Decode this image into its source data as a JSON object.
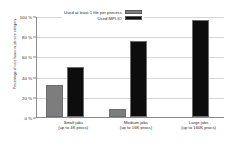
{
  "chart_data": {
    "type": "bar",
    "title": "",
    "xlabel": "",
    "ylabel": "Percentage of core hours in job size category",
    "categories": [
      "Small jobs\n(up to 4K procs)",
      "Medium jobs\n(up to 16K procs)",
      "Large jobs\n(up to 160K procs)"
    ],
    "category_lines": [
      {
        "line1": "Small jobs",
        "line2": "(up to 4K procs)"
      },
      {
        "line1": "Medium jobs",
        "line2": "(up to 16K procs)"
      },
      {
        "line1": "Large jobs",
        "line2": "(up to 160K procs)"
      }
    ],
    "series": [
      {
        "name": "Used at least 1 file per process",
        "color": "#7d7d7d",
        "values": [
          32,
          8,
          0
        ]
      },
      {
        "name": "Used MPI-IO",
        "color": "#0d0d0d",
        "values": [
          50,
          75,
          96
        ]
      }
    ],
    "ylim": [
      0,
      100
    ],
    "yticks": [
      0,
      20,
      40,
      60,
      80,
      100
    ],
    "ytick_labels": [
      "0 %",
      "20 %",
      "40 %",
      "60 %",
      "80 %",
      "100 %"
    ],
    "grid": true,
    "legend_position": "top-center"
  },
  "legend": {
    "items": [
      {
        "label": "Used at least 1 file per process"
      },
      {
        "label": "Used MPI-IO"
      }
    ]
  }
}
